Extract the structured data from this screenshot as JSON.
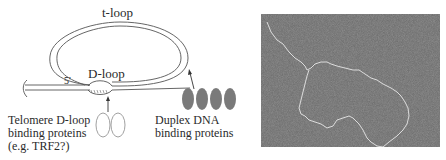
{
  "diagram": {
    "labels": {
      "t_loop": "t-loop",
      "d_loop": "D-loop",
      "five_prime": "5'",
      "telomere_line1": "Telomere D-loop",
      "telomere_line2": "binding proteins",
      "telomere_line3": "(e.g. TRF2?)",
      "duplex_line1": "Duplex DNA",
      "duplex_line2": "binding proteins"
    },
    "colors": {
      "strand": "#555555",
      "duplex_protein_fill": "#7a7a7a",
      "dloop_protein_stroke": "#888888"
    },
    "duplex_protein_count": 4,
    "dloop_protein_count": 2
  },
  "micrograph": {
    "description": "Electron micrograph of t-loop DNA",
    "background": "#6e6e6e",
    "strand_color": "#e8e8e8"
  }
}
